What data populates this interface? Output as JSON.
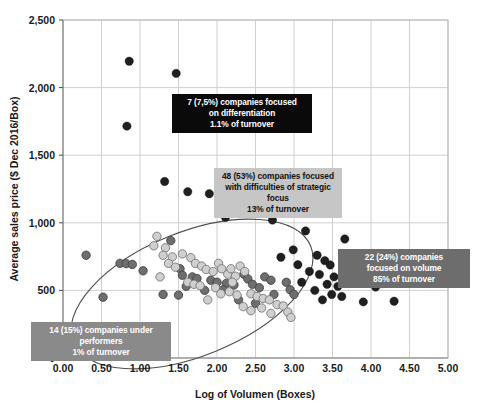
{
  "chart_data": {
    "type": "scatter",
    "title": "",
    "xlabel": "Log of Volumen (Boxes)",
    "ylabel": "Average sales price ($ Dec 2016/Box)",
    "xlim": [
      0,
      5
    ],
    "ylim": [
      0,
      2500
    ],
    "xticks": [
      "0.00",
      "0.50",
      "1.00",
      "1.50",
      "2.00",
      "2.50",
      "3.00",
      "3.50",
      "4.00",
      "4.50",
      "5.00"
    ],
    "xtick_values": [
      0,
      0.5,
      1,
      1.5,
      2,
      2.5,
      3,
      3.5,
      4,
      4.5,
      5
    ],
    "ytick_values": [
      0,
      500,
      1000,
      1500,
      2000,
      2500
    ],
    "yticks": [
      "0",
      "500",
      "1,000",
      "1,500",
      "2,000",
      "2,500"
    ],
    "grid": true,
    "legend": "none",
    "marker_colors": {
      "dark": "#1f1f1f",
      "medium": "#6e6e6e",
      "light": "#cfcfcf"
    },
    "series": [
      {
        "name": "differentiation-high-price",
        "shade": "dark",
        "points": [
          [
            0.86,
            2195
          ],
          [
            1.47,
            2105
          ],
          [
            0.83,
            1715
          ],
          [
            1.32,
            1305
          ],
          [
            1.62,
            1230
          ],
          [
            1.9,
            1215
          ],
          [
            2.11,
            1040
          ]
        ]
      },
      {
        "name": "volume-focused",
        "shade": "dark",
        "points": [
          [
            2.72,
            1020
          ],
          [
            3.15,
            940
          ],
          [
            3.66,
            880
          ],
          [
            2.99,
            800
          ],
          [
            3.3,
            760
          ],
          [
            2.83,
            745
          ],
          [
            3.4,
            720
          ],
          [
            3.47,
            688
          ],
          [
            3.05,
            690
          ],
          [
            3.2,
            640
          ],
          [
            3.33,
            618
          ],
          [
            3.52,
            600
          ],
          [
            3.1,
            560
          ],
          [
            3.43,
            545
          ],
          [
            3.57,
            530
          ],
          [
            3.27,
            500
          ],
          [
            3.49,
            470
          ],
          [
            3.62,
            455
          ],
          [
            3.37,
            430
          ],
          [
            4.06,
            525
          ],
          [
            4.3,
            420
          ],
          [
            3.9,
            415
          ]
        ]
      },
      {
        "name": "strategic-focus-difficulties",
        "shade": "medium",
        "points": [
          [
            0.3,
            760
          ],
          [
            0.74,
            700
          ],
          [
            0.82,
            698
          ],
          [
            0.9,
            692
          ],
          [
            1.04,
            645
          ],
          [
            0.52,
            450
          ],
          [
            1.4,
            868
          ],
          [
            1.52,
            660
          ],
          [
            1.55,
            612
          ],
          [
            1.68,
            600
          ],
          [
            1.74,
            588
          ],
          [
            1.92,
            575
          ],
          [
            2.0,
            560
          ],
          [
            2.12,
            552
          ],
          [
            2.22,
            540
          ],
          [
            2.08,
            505
          ],
          [
            1.84,
            500
          ],
          [
            1.6,
            530
          ],
          [
            2.35,
            620
          ],
          [
            2.4,
            585
          ],
          [
            2.46,
            545
          ],
          [
            2.55,
            520
          ],
          [
            2.62,
            600
          ],
          [
            2.7,
            575
          ],
          [
            1.3,
            470
          ],
          [
            1.5,
            465
          ],
          [
            2.28,
            430
          ],
          [
            2.5,
            405
          ],
          [
            2.74,
            470
          ],
          [
            2.9,
            560
          ],
          [
            2.95,
            505
          ],
          [
            3.0,
            470
          ]
        ]
      },
      {
        "name": "mid-cluster-light",
        "shade": "light",
        "points": [
          [
            1.22,
            900
          ],
          [
            1.18,
            830
          ],
          [
            1.33,
            815
          ],
          [
            1.3,
            760
          ],
          [
            1.42,
            748
          ],
          [
            1.37,
            700
          ],
          [
            1.46,
            672
          ],
          [
            1.55,
            770
          ],
          [
            1.66,
            742
          ],
          [
            1.72,
            700
          ],
          [
            1.8,
            680
          ],
          [
            1.86,
            655
          ],
          [
            1.95,
            640
          ],
          [
            2.02,
            700
          ],
          [
            2.06,
            660
          ],
          [
            2.14,
            620
          ],
          [
            2.18,
            660
          ],
          [
            2.24,
            605
          ],
          [
            2.3,
            680
          ],
          [
            2.36,
            640
          ],
          [
            1.62,
            560
          ],
          [
            1.7,
            545
          ],
          [
            1.78,
            535
          ],
          [
            1.98,
            520
          ],
          [
            2.05,
            475
          ],
          [
            2.16,
            490
          ],
          [
            2.26,
            465
          ],
          [
            2.44,
            475
          ],
          [
            2.52,
            455
          ],
          [
            2.6,
            440
          ],
          [
            2.68,
            430
          ],
          [
            2.34,
            380
          ],
          [
            2.58,
            370
          ],
          [
            2.78,
            395
          ],
          [
            2.86,
            385
          ],
          [
            2.92,
            340
          ],
          [
            1.88,
            430
          ],
          [
            2.44,
            350
          ],
          [
            2.7,
            330
          ],
          [
            2.96,
            300
          ],
          [
            1.26,
            600
          ],
          [
            2.2,
            560
          ]
        ]
      }
    ],
    "ellipse": {
      "cx": 192,
      "cy": 294,
      "rx": 128,
      "ry": 62,
      "rotation": -22
    },
    "annotations": [
      {
        "id": "differentiation",
        "style": "dark",
        "lines": [
          "7 (7,5%) companies focused",
          "on differentiation",
          "1.1% of turnover"
        ]
      },
      {
        "id": "strategic-focus",
        "style": "light",
        "lines": [
          "48 (53%) companies focused",
          "with difficulties of strategic",
          "focus",
          "13% of turnover"
        ]
      },
      {
        "id": "volume",
        "style": "mid",
        "lines": [
          "22 (24%) companies",
          "focused on volume",
          "85% of turnover"
        ]
      },
      {
        "id": "under-performers",
        "style": "midgray",
        "lines": [
          "14 (15%) companies under",
          "performers",
          "1% of turnover"
        ]
      }
    ]
  },
  "footer": {
    "text": ""
  }
}
